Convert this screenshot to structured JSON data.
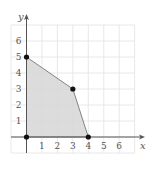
{
  "chart_data": {
    "type": "area",
    "title": "",
    "xlabel": "x",
    "ylabel": "y",
    "xlim": [
      -1,
      7
    ],
    "ylim": [
      -1,
      7
    ],
    "grid": true,
    "x_ticks": [
      1,
      2,
      3,
      4,
      5,
      6
    ],
    "y_ticks": [
      1,
      2,
      3,
      4,
      5,
      6
    ],
    "feasible_region": {
      "vertices": [
        [
          0,
          0
        ],
        [
          0,
          5
        ],
        [
          3,
          3
        ],
        [
          4,
          0
        ]
      ],
      "fill_color": "#d6d6d6",
      "edge_color": "#777777"
    },
    "points": [
      {
        "x": 0,
        "y": 0
      },
      {
        "x": 0,
        "y": 5
      },
      {
        "x": 3,
        "y": 3
      },
      {
        "x": 4,
        "y": 0
      }
    ],
    "colors": {
      "grid": "#e2e2e2",
      "axis": "#555555",
      "point": "#111111"
    }
  }
}
